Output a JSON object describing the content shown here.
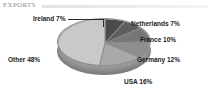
{
  "header": {
    "title": "EXPORTS",
    "rule_color": "#e2e2e2"
  },
  "chart_data": {
    "type": "pie",
    "title": "EXPORTS",
    "xlabel": "",
    "ylabel": "",
    "legend_position": "none",
    "grid": false,
    "three_d": true,
    "categories": [
      "Ireland",
      "Netherlands",
      "France",
      "Germany",
      "USA",
      "Other"
    ],
    "values": [
      7,
      7,
      10,
      12,
      16,
      48
    ],
    "unit": "%",
    "labels": [
      "Ireland 7%",
      "Netherlands 7%",
      "France 10%",
      "Germany 12%",
      "USA 16%",
      "Other 48%"
    ],
    "slice_colors": [
      "#4a4a4a",
      "#5f5f5f",
      "#777777",
      "#8e8e8e",
      "#a9a9a9",
      "#c9c9c9"
    ],
    "side_color": "#9b9b9b",
    "outline_color": "#8e8e8e",
    "label_color": "#1b1b1b",
    "leader_lines": [
      "Ireland 7%"
    ],
    "total": 100
  }
}
